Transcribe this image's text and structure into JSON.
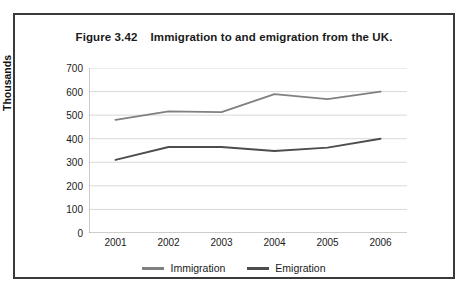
{
  "figure": {
    "title": "Figure 3.42    Immigration to and emigration from the UK."
  },
  "chart_data": {
    "type": "line",
    "title": "Figure 3.42    Immigration to and emigration from the UK.",
    "xlabel": "",
    "ylabel": "Thousands",
    "categories": [
      "2001",
      "2002",
      "2003",
      "2004",
      "2005",
      "2006"
    ],
    "x": [
      2001,
      2002,
      2003,
      2004,
      2005,
      2006
    ],
    "series": [
      {
        "name": "Immigration",
        "color": "#808080",
        "values": [
          480,
          516,
          513,
          589,
          568,
          600
        ]
      },
      {
        "name": "Emigration",
        "color": "#4d4d4d",
        "values": [
          310,
          365,
          365,
          348,
          362,
          400
        ]
      }
    ],
    "ylim": [
      0,
      700
    ],
    "yticks": [
      0,
      100,
      200,
      300,
      400,
      500,
      600,
      700
    ],
    "ytick_labels": [
      "0",
      "100",
      "200",
      "300",
      "400",
      "500",
      "600",
      "700"
    ],
    "grid": true,
    "grid_axis": "y",
    "legend_position": "bottom"
  },
  "legend": {
    "entries": [
      {
        "label": "Immigration",
        "color": "#808080"
      },
      {
        "label": "Emigration",
        "color": "#4d4d4d"
      }
    ]
  },
  "colors": {
    "frame": "#3a3a3a",
    "gridline": "#d9d9d9",
    "axis": "#9a9a9a",
    "background": "#ffffff",
    "text": "#1a1a1a"
  }
}
